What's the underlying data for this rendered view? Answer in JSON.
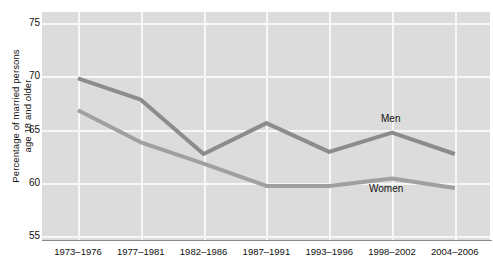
{
  "chart_data": {
    "type": "line",
    "title": "",
    "xlabel": "",
    "ylabel": "Percentage of married persons\nage 18 and older",
    "categories": [
      "1973–1976",
      "1977–1981",
      "1982–1986",
      "1987–1991",
      "1993–1996",
      "1998–2002",
      "2004–2006"
    ],
    "ylim": [
      55,
      75
    ],
    "yticks": [
      75,
      70,
      65,
      60,
      55
    ],
    "ytick_labels": [
      "75",
      "70",
      "65",
      "60",
      "55"
    ],
    "grid": true,
    "legend_position": "inline-annotations",
    "series": [
      {
        "name": "Men",
        "color": "#8c8c8c",
        "values": [
          69.8,
          67.8,
          62.7,
          65.6,
          62.9,
          64.7,
          62.7
        ]
      },
      {
        "name": "Women",
        "color": "#a0a0a0",
        "values": [
          66.8,
          63.8,
          61.8,
          59.7,
          59.7,
          60.4,
          59.5
        ]
      }
    ],
    "annotations": [
      {
        "text": "Men",
        "series": "Men"
      },
      {
        "text": "Women",
        "series": "Women"
      }
    ]
  },
  "colors": {
    "plot_background": "#dcdcdc",
    "gridline": "#f7f7f7",
    "axis": "#8b8b8b",
    "men_line": "#8c8c8c",
    "women_line": "#a0a0a0",
    "text": "#111111"
  }
}
